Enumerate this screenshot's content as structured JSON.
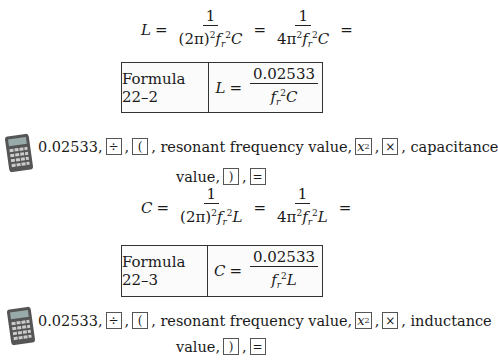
{
  "equation_L": {
    "lhs": "L",
    "eq": "=",
    "frac1": {
      "num": "1",
      "den_a": "(2π)",
      "den_sup": "2",
      "den_f": "f",
      "den_sub": "r",
      "den_sup2": "2",
      "den_var": "C"
    },
    "frac2": {
      "num": "1",
      "den_a": "4π",
      "den_sup": "2",
      "den_f": "f",
      "den_sub": "r",
      "den_sup2": "2",
      "den_var": "C"
    },
    "trailing": "="
  },
  "formula_box_1": {
    "label": "Formula 22–2",
    "lhs": "L",
    "eq": "=",
    "num": "0.02533",
    "den_f": "f",
    "den_sub": "r",
    "den_sup": "2",
    "den_var": "C"
  },
  "calculator_steps_1": {
    "value": "0.02533,",
    "keys": {
      "divide": "÷",
      "open_paren": "(",
      "square": "x",
      "square_sup": "2",
      "multiply": "×",
      "close_paren": ")",
      "equals": "="
    },
    "text_resonant": ", resonant frequency value,",
    "text_comma": ",",
    "text_second_var": ", capacitance",
    "text_value": "value,"
  },
  "equation_C": {
    "lhs": "C",
    "eq": "=",
    "frac1": {
      "num": "1",
      "den_a": "(2π)",
      "den_sup": "2",
      "den_f": "f",
      "den_sub": "r",
      "den_sup2": "2",
      "den_var": "L"
    },
    "frac2": {
      "num": "1",
      "den_a": "4π",
      "den_sup": "2",
      "den_f": "f",
      "den_sub": "r",
      "den_sup2": "2",
      "den_var": "L"
    },
    "trailing": "="
  },
  "formula_box_2": {
    "label": "Formula 22–3",
    "lhs": "C",
    "eq": "=",
    "num": "0.02533",
    "den_f": "f",
    "den_sub": "r",
    "den_sup": "2",
    "den_var": "L"
  },
  "calculator_steps_2": {
    "value": "0.02533,",
    "keys": {
      "divide": "÷",
      "open_paren": "(",
      "square": "x",
      "square_sup": "2",
      "multiply": "×",
      "close_paren": ")",
      "equals": "="
    },
    "text_resonant": ", resonant frequency value,",
    "text_comma": ",",
    "text_second_var": ", inductance",
    "text_value": "value,"
  },
  "icons": {
    "calculator": "calculator-icon"
  }
}
